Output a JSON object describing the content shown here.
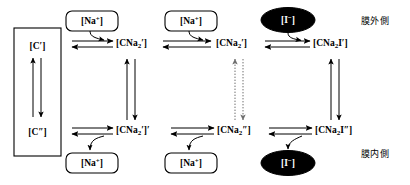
{
  "diagram": {
    "background_color": "#ffffff",
    "stroke_color": "#000000",
    "ellipse_fill": "#000000",
    "ellipse_text_color": "#ffffff"
  },
  "carrier_box": {
    "top_label_html": "[C&prime;]",
    "bottom_label_html": "[C&Prime;]"
  },
  "outer_row": {
    "node1_html": "[CNa<sub>2</sub>&prime;]",
    "node2_html": "[CNa<sub>2</sub>&prime;]",
    "node3_html": "[CNa<sub>2</sub>I&prime;]"
  },
  "inner_row": {
    "node1_html": "[CNa<sub>2</sub>&prime;]&prime;",
    "node2_html": "[CNa<sub>2</sub>&Prime;]",
    "node3_html": "[CNa<sub>2</sub>I&Prime;]"
  },
  "reactants": {
    "top_sodium_1_html": "[Na<sup>+</sup>]",
    "top_sodium_2_html": "[Na<sup>+</sup>]",
    "top_iodide_html": "[I<sup>&minus;</sup>]",
    "bottom_sodium_1_html": "[Na<sup>+</sup>]",
    "bottom_sodium_2_html": "[Na<sup>+</sup>]",
    "bottom_iodide_html": "[I<sup>&minus;</sup>]"
  },
  "side_labels": {
    "outer": "膜外側",
    "inner": "膜内側"
  }
}
